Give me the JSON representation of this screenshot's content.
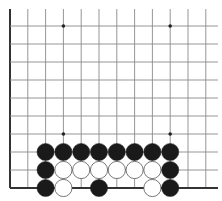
{
  "board": {
    "title": "Go board diagram (lower-left corner section)",
    "colors": {
      "background": "#ffffff",
      "line": "#8a8a8a",
      "edge": "#333333",
      "black_stone": "#1a1a1a",
      "white_stone": "#ffffff",
      "white_stone_border": "#555555",
      "star_point": "#222222"
    },
    "columns_x": [
      10,
      27.8,
      45.6,
      63.4,
      81.2,
      99,
      116.8,
      134.6,
      152.4,
      170.2,
      188,
      205.8
    ],
    "rows_y": [
      26,
      44,
      62,
      80,
      98,
      116,
      134,
      152,
      170,
      188
    ],
    "left_edge": true,
    "bottom_edge": true,
    "star_points": [
      {
        "col": 3,
        "row": 0
      },
      {
        "col": 9,
        "row": 0
      },
      {
        "col": 3,
        "row": 6
      },
      {
        "col": 9,
        "row": 6
      }
    ],
    "stones": [
      {
        "color": "black",
        "col": 2,
        "row": 7
      },
      {
        "color": "black",
        "col": 3,
        "row": 7
      },
      {
        "color": "black",
        "col": 4,
        "row": 7
      },
      {
        "color": "black",
        "col": 5,
        "row": 7
      },
      {
        "color": "black",
        "col": 6,
        "row": 7
      },
      {
        "color": "black",
        "col": 7,
        "row": 7
      },
      {
        "color": "black",
        "col": 8,
        "row": 7
      },
      {
        "color": "black",
        "col": 9,
        "row": 7
      },
      {
        "color": "black",
        "col": 2,
        "row": 8
      },
      {
        "color": "white",
        "col": 3,
        "row": 8
      },
      {
        "color": "white",
        "col": 4,
        "row": 8
      },
      {
        "color": "white",
        "col": 5,
        "row": 8
      },
      {
        "color": "white",
        "col": 6,
        "row": 8
      },
      {
        "color": "white",
        "col": 7,
        "row": 8
      },
      {
        "color": "white",
        "col": 8,
        "row": 8
      },
      {
        "color": "black",
        "col": 9,
        "row": 8
      },
      {
        "color": "black",
        "col": 2,
        "row": 9
      },
      {
        "color": "white",
        "col": 3,
        "row": 9
      },
      {
        "color": "black",
        "col": 5,
        "row": 9
      },
      {
        "color": "white",
        "col": 8,
        "row": 9
      },
      {
        "color": "black",
        "col": 9,
        "row": 9
      }
    ],
    "stone_radius": 8.6
  }
}
